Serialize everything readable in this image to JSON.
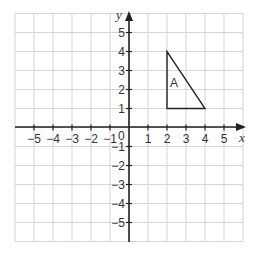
{
  "figure": {
    "type": "coordinate-grid",
    "x_axis_label": "x",
    "y_axis_label": "y",
    "origin_label": "0",
    "x_range": [
      -6,
      6
    ],
    "y_range": [
      -6,
      6
    ],
    "x_ticks": [
      "−5",
      "−4",
      "−3",
      "−2",
      "−1",
      "1",
      "2",
      "3",
      "4",
      "5"
    ],
    "y_ticks": [
      "5",
      "4",
      "3",
      "2",
      "1",
      "−1",
      "−2",
      "−3",
      "−4",
      "−5"
    ],
    "shape": {
      "name": "A",
      "label": "A",
      "type": "triangle",
      "vertices": [
        [
          2,
          1
        ],
        [
          2,
          4
        ],
        [
          4,
          1
        ]
      ]
    },
    "colors": {
      "grid": "#d4d4d4",
      "axes": "#222222",
      "shape": "#222222"
    }
  }
}
